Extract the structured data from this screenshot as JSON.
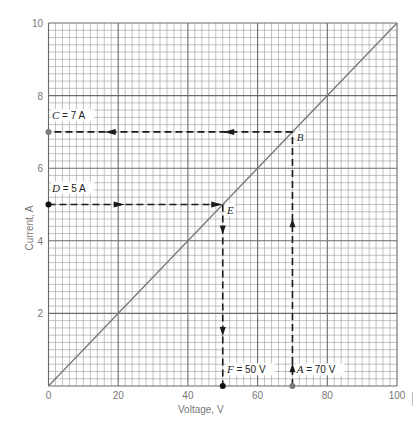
{
  "chart_data": {
    "type": "line",
    "title": "",
    "xlabel": "Voltage, V",
    "ylabel": "Current, A",
    "xlim": [
      0,
      100
    ],
    "ylim": [
      0,
      10
    ],
    "x_ticks": [
      0,
      20,
      40,
      60,
      80,
      100
    ],
    "x_tick_labels": [
      "0",
      "20",
      "40",
      "60",
      "80",
      "100"
    ],
    "y_ticks": [
      2,
      4,
      6,
      8,
      10
    ],
    "y_tick_labels": [
      "2",
      "4",
      "6",
      "8",
      "10"
    ],
    "grid": {
      "on": true,
      "major_x": 20,
      "major_y": 2,
      "minor_divisions": 10
    },
    "legend": null,
    "series": [
      {
        "name": "I-V line",
        "x": [
          0,
          100
        ],
        "y": [
          0,
          10
        ],
        "style": "solid"
      }
    ],
    "points": [
      {
        "id": "A",
        "x": 70,
        "y": 0,
        "label": "A = 70 V",
        "marker": "gray-dot"
      },
      {
        "id": "B",
        "x": 70,
        "y": 7,
        "label": "B",
        "marker": "none"
      },
      {
        "id": "C",
        "x": 0,
        "y": 7,
        "label": "C = 7 A",
        "marker": "gray-dot"
      },
      {
        "id": "D",
        "x": 0,
        "y": 5,
        "label": "D = 5 A",
        "marker": "black-dot"
      },
      {
        "id": "E",
        "x": 50,
        "y": 5,
        "label": "E",
        "marker": "none"
      },
      {
        "id": "F",
        "x": 50,
        "y": 0,
        "label": "F = 50 V",
        "marker": "black-dot"
      }
    ],
    "paths": [
      {
        "name": "A-to-B",
        "from": [
          70,
          0
        ],
        "to": [
          70,
          7
        ],
        "style": "dashed",
        "arrows_at": [
          0.5,
          4.5
        ],
        "direction": "up"
      },
      {
        "name": "B-to-C",
        "from": [
          70,
          7
        ],
        "to": [
          0,
          7
        ],
        "style": "dashed",
        "arrows_at": [
          52,
          18
        ],
        "direction": "left"
      },
      {
        "name": "D-to-E",
        "from": [
          0,
          5
        ],
        "to": [
          50,
          5
        ],
        "style": "dashed",
        "arrows_at": [
          20,
          48
        ],
        "direction": "right"
      },
      {
        "name": "E-to-F",
        "from": [
          50,
          5
        ],
        "to": [
          50,
          0
        ],
        "style": "dashed",
        "arrows_at": [
          4.3,
          1.5
        ],
        "direction": "down"
      }
    ],
    "annotations": [
      {
        "text": "C = 7 A",
        "x": 1,
        "y": 7.35
      },
      {
        "text": "D = 5 A",
        "x": 1,
        "y": 5.35
      },
      {
        "text": "B",
        "x": 71.2,
        "y": 6.75
      },
      {
        "text": "E",
        "x": 51.2,
        "y": 4.75
      },
      {
        "text": "F = 50 V",
        "x": 51.2,
        "y": 0.35
      },
      {
        "text": "A = 70 V",
        "x": 71.2,
        "y": 0.35
      }
    ]
  },
  "colors": {
    "background": "#ffffff",
    "minor_grid": "#9a9a9a",
    "major_grid": "#6a6a6a",
    "diagonal": "#777777",
    "dashed": "#1a1a1a",
    "tick_text": "#777777",
    "label_text": "#222222",
    "gray_dot": "#7a7a7a",
    "black_dot": "#111111"
  }
}
